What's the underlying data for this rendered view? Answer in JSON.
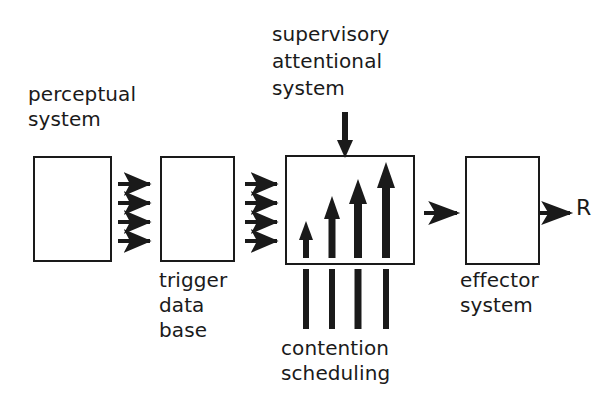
{
  "diagram": {
    "stroke_color": "#1a1a1a",
    "background_color": "#ffffff",
    "width": 601,
    "height": 410
  },
  "labels": {
    "perceptual_line1": "perceptual",
    "perceptual_line2": "system",
    "trigger_line1": "trigger",
    "trigger_line2": "data",
    "trigger_line3": "base",
    "supervisory_line1": "supervisory",
    "supervisory_line2": "attentional",
    "supervisory_line3": "system",
    "contention_line1": "contention",
    "contention_line2": "scheduling",
    "effector_line1": "effector",
    "effector_line2": "system",
    "response": "R"
  },
  "boxes": [
    {
      "name": "perceptual-system-box",
      "x": 33,
      "y": 156,
      "w": 79,
      "h": 106
    },
    {
      "name": "trigger-data-base-box",
      "x": 160,
      "y": 156,
      "w": 75,
      "h": 106
    },
    {
      "name": "contention-scheduling-box",
      "x": 285,
      "y": 155,
      "w": 130,
      "h": 110
    },
    {
      "name": "effector-system-box",
      "x": 465,
      "y": 156,
      "w": 75,
      "h": 109
    }
  ],
  "connectors": {
    "perceptual_to_trigger_count": 4,
    "trigger_to_contention_count": 4,
    "contention_to_effector_count": 1,
    "effector_to_response_count": 1,
    "supervisory_down_arrow_count": 1,
    "activation_arrows_count": 4,
    "contention_stems_count": 4
  }
}
